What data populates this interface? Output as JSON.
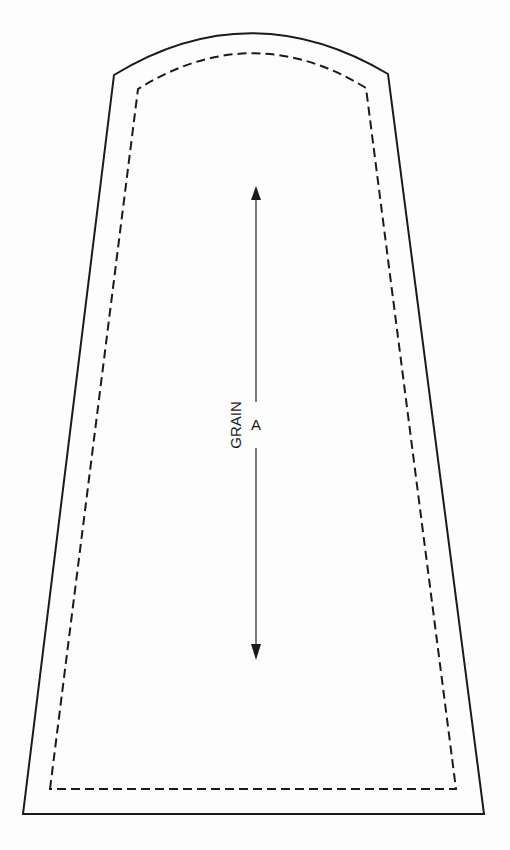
{
  "diagram": {
    "type": "sewing-pattern-piece",
    "grain_label": "GRAIN",
    "piece_label": "A",
    "lines": {
      "cutting_line": "solid",
      "seam_line": "dashed"
    },
    "grainline": "double-headed arrow, vertical",
    "colors": {
      "line": "#1a1a1a",
      "background": "#fdfdfd"
    }
  }
}
